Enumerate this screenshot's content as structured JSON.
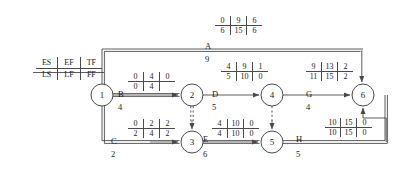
{
  "diagram": {
    "stroke_color": "#4a4a4a",
    "text_color": "#1a1a1a",
    "background": "#ffffff"
  },
  "legend": {
    "name": "time-key",
    "row_top": [
      "ES",
      "EF",
      "TF"
    ],
    "row_bottom": [
      "LS",
      "LF",
      "FF"
    ]
  },
  "nodes": [
    {
      "id": "1",
      "label": "1"
    },
    {
      "id": "2",
      "label": "2"
    },
    {
      "id": "3",
      "label": "3"
    },
    {
      "id": "4",
      "label": "4"
    },
    {
      "id": "5",
      "label": "5"
    },
    {
      "id": "6",
      "label": "6"
    }
  ],
  "activities": [
    {
      "name": "A",
      "duration": "9",
      "from": "1",
      "to": "6",
      "dummy": false,
      "box": {
        "es": "0",
        "ef": "9",
        "tf": "6",
        "ls": "6",
        "lf": "15",
        "ff": "6"
      }
    },
    {
      "name": "B",
      "duration": "4",
      "from": "1",
      "to": "2",
      "dummy": false,
      "box": {
        "es": "0",
        "ef": "4",
        "tf": "0",
        "ls": "0",
        "lf": "4",
        "ff": ""
      }
    },
    {
      "name": "C",
      "duration": "2",
      "from": "1",
      "to": "3",
      "dummy": false,
      "box": {
        "es": "0",
        "ef": "2",
        "tf": "2",
        "ls": "2",
        "lf": "4",
        "ff": "2"
      }
    },
    {
      "name": "D",
      "duration": "5",
      "from": "2",
      "to": "4",
      "dummy": false,
      "box": {
        "es": "4",
        "ef": "9",
        "tf": "1",
        "ls": "5",
        "lf": "10",
        "ff": "0"
      }
    },
    {
      "name": "E",
      "duration": "6",
      "from": "3",
      "to": "5",
      "dummy": false,
      "box": {
        "es": "4",
        "ef": "10",
        "tf": "0",
        "ls": "4",
        "lf": "10",
        "ff": "0"
      }
    },
    {
      "name": "G",
      "duration": "4",
      "from": "4",
      "to": "6",
      "dummy": false,
      "box": {
        "es": "9",
        "ef": "13",
        "tf": "2",
        "ls": "11",
        "lf": "15",
        "ff": "2"
      }
    },
    {
      "name": "H",
      "duration": "5",
      "from": "5",
      "to": "6",
      "dummy": false,
      "box": {
        "es": "10",
        "ef": "15",
        "tf": "0",
        "ls": "10",
        "lf": "15",
        "ff": "0"
      }
    },
    {
      "name": "",
      "duration": "",
      "from": "2",
      "to": "3",
      "dummy": true,
      "box": null
    },
    {
      "name": "",
      "duration": "",
      "from": "4",
      "to": "5",
      "dummy": true,
      "box": null
    }
  ]
}
